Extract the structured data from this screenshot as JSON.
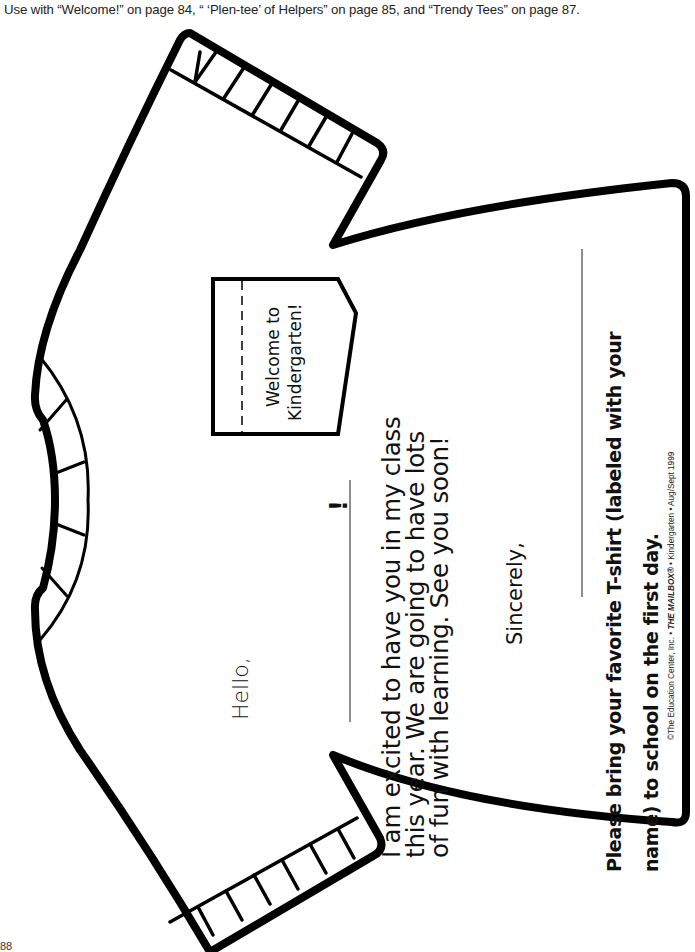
{
  "header": {
    "note": "Use with “Welcome!” on page 84, “ ‘Plen-tee’ of Helpers” on page 85, and “Trendy Tees” on page 87."
  },
  "tag": {
    "line1": "Welcome to",
    "line2": "Kindergarten!"
  },
  "letter": {
    "greeting": "Hello,",
    "name_blank_punctuation": "!",
    "body_lines": [
      "I am excited to have you in my class",
      "this year. We are going to have lots",
      "of fun with learning. See you soon!"
    ],
    "closing": "Sincerely,"
  },
  "note": {
    "lines": [
      "Please bring your favorite T-shirt (labeled with your",
      "name) to school on the first day."
    ]
  },
  "copyright": {
    "prefix": "©The Education Center, Inc. • ",
    "publication": "THE MAILBOX®",
    "suffix": " • Kindergarten • Aug/Sept 1999"
  },
  "page": {
    "number": "88"
  },
  "colors": {
    "outline": "#000000",
    "background": "#ffffff",
    "text": "#111111"
  }
}
